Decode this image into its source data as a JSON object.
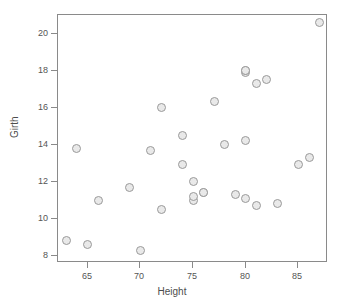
{
  "chart_data": {
    "type": "scatter",
    "title": "",
    "xlabel": "Height",
    "ylabel": "Girth",
    "xlim": [
      62.2,
      87.8
    ],
    "ylim": [
      7.6,
      21.0
    ],
    "grid": false,
    "legend": null,
    "xticks": [
      65,
      70,
      75,
      80,
      85
    ],
    "yticks": [
      8,
      10,
      12,
      14,
      16,
      18,
      20
    ],
    "marker": {
      "shape": "circle",
      "fill": "#e9e9e9",
      "edge": "#9a9a9a",
      "size_px": 9
    },
    "n_points": 31,
    "x": [
      70,
      65,
      63,
      72,
      81,
      83,
      66,
      75,
      80,
      75,
      79,
      76,
      76,
      69,
      75,
      74,
      85,
      86,
      71,
      64,
      78,
      80,
      74,
      72,
      77,
      81,
      82,
      80,
      80,
      80,
      87
    ],
    "y": [
      8.3,
      8.6,
      8.8,
      10.5,
      10.7,
      10.8,
      11.0,
      11.0,
      11.1,
      11.2,
      11.3,
      11.4,
      11.4,
      11.7,
      12.0,
      12.9,
      12.9,
      13.3,
      13.7,
      13.8,
      14.0,
      14.2,
      14.5,
      16.0,
      16.3,
      17.3,
      17.5,
      17.9,
      18.0,
      18.0,
      20.6
    ],
    "points": [
      {
        "x": 70,
        "y": 8.3
      },
      {
        "x": 65,
        "y": 8.6
      },
      {
        "x": 63,
        "y": 8.8
      },
      {
        "x": 72,
        "y": 10.5
      },
      {
        "x": 81,
        "y": 10.7
      },
      {
        "x": 83,
        "y": 10.8
      },
      {
        "x": 66,
        "y": 11.0
      },
      {
        "x": 75,
        "y": 11.0
      },
      {
        "x": 80,
        "y": 11.1
      },
      {
        "x": 75,
        "y": 11.2
      },
      {
        "x": 79,
        "y": 11.3
      },
      {
        "x": 76,
        "y": 11.4
      },
      {
        "x": 76,
        "y": 11.4
      },
      {
        "x": 69,
        "y": 11.7
      },
      {
        "x": 75,
        "y": 12.0
      },
      {
        "x": 74,
        "y": 12.9
      },
      {
        "x": 85,
        "y": 12.9
      },
      {
        "x": 86,
        "y": 13.3
      },
      {
        "x": 71,
        "y": 13.7
      },
      {
        "x": 64,
        "y": 13.8
      },
      {
        "x": 78,
        "y": 14.0
      },
      {
        "x": 80,
        "y": 14.2
      },
      {
        "x": 74,
        "y": 14.5
      },
      {
        "x": 72,
        "y": 16.0
      },
      {
        "x": 77,
        "y": 16.3
      },
      {
        "x": 81,
        "y": 17.3
      },
      {
        "x": 82,
        "y": 17.5
      },
      {
        "x": 80,
        "y": 17.9
      },
      {
        "x": 80,
        "y": 18.0
      },
      {
        "x": 80,
        "y": 18.0
      },
      {
        "x": 87,
        "y": 20.6
      }
    ]
  },
  "axes": {
    "x_title": "Height",
    "y_title": "Girth",
    "x_tick_labels": [
      "65",
      "70",
      "75",
      "80",
      "85"
    ],
    "y_tick_labels": [
      "8",
      "10",
      "12",
      "14",
      "16",
      "18",
      "20"
    ]
  },
  "colors": {
    "background": "#ffffff",
    "frame": "#8a8a8a",
    "tick": "#8a8a8a",
    "text": "#555555",
    "marker_fill": "#e9e9e9",
    "marker_edge": "#9a9a9a"
  }
}
